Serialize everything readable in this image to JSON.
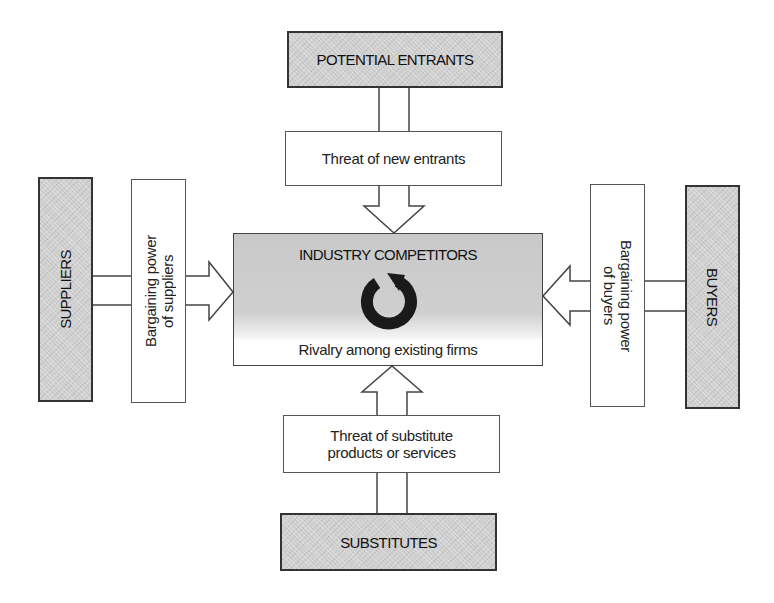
{
  "diagram": {
    "type": "porters-five-forces",
    "nodes": {
      "potential_entrants": "POTENTIAL ENTRANTS",
      "threat_new_entrants": "Threat of new entrants",
      "industry_competitors": "INDUSTRY COMPETITORS",
      "rivalry": "Rivalry among existing firms",
      "suppliers": "SUPPLIERS",
      "bargaining_suppliers_line1": "Bargaining power",
      "bargaining_suppliers_line2": "of suppliers",
      "buyers": "BUYERS",
      "bargaining_buyers_line1": "Bargaining power",
      "bargaining_buyers_line2": "of buyers",
      "threat_substitutes_line1": "Threat of substitute",
      "threat_substitutes_line2": "products or services",
      "substitutes": "SUBSTITUTES"
    },
    "edges": [
      {
        "from": "POTENTIAL ENTRANTS",
        "via": "Threat of new entrants",
        "to": "INDUSTRY COMPETITORS",
        "direction": "down"
      },
      {
        "from": "SUPPLIERS",
        "via": "Bargaining power of suppliers",
        "to": "INDUSTRY COMPETITORS",
        "direction": "right"
      },
      {
        "from": "BUYERS",
        "via": "Bargaining power of buyers",
        "to": "INDUSTRY COMPETITORS",
        "direction": "left"
      },
      {
        "from": "SUBSTITUTES",
        "via": "Threat of substitute products or services",
        "to": "INDUSTRY COMPETITORS",
        "direction": "up"
      }
    ],
    "icons": {
      "center": "circular-arrow-icon"
    },
    "colors": {
      "shaded_box": "#cfcfcf",
      "border": "#333333",
      "icon": "#1a1a1a"
    }
  }
}
